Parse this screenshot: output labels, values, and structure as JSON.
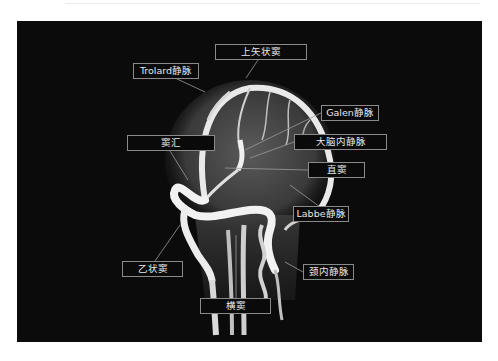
{
  "figure": {
    "background_color": "#0b0b0b",
    "label_border_color": "#8a8a8a",
    "label_text_color": "#e8e8e8"
  },
  "labels": [
    {
      "id": "superior-sagittal-sinus",
      "text": "上矢状窦"
    },
    {
      "id": "trolard-vein",
      "text": "Trolard静脉"
    },
    {
      "id": "galen-vein",
      "text": "Galen静脉"
    },
    {
      "id": "internal-cerebral-vein",
      "text": "大脑内静脉"
    },
    {
      "id": "straight-sinus",
      "text": "直窦"
    },
    {
      "id": "confluence-of-sinuses",
      "text": "窦汇"
    },
    {
      "id": "labbe-vein",
      "text": "Labbe静脉"
    },
    {
      "id": "sigmoid-sinus",
      "text": "乙状窦"
    },
    {
      "id": "internal-jugular-vein",
      "text": "颈内静脉"
    },
    {
      "id": "transverse-sinus",
      "text": "横窦"
    }
  ]
}
